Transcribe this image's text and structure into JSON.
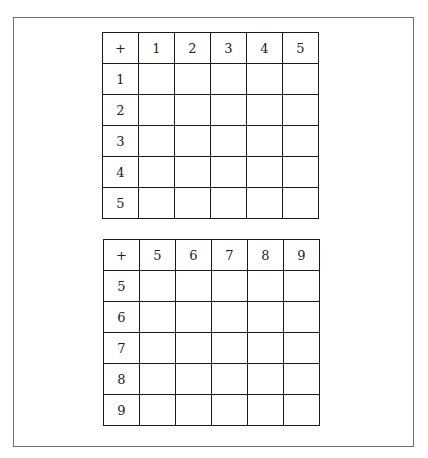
{
  "tables": [
    {
      "corner": "+",
      "columns": [
        "1",
        "2",
        "3",
        "4",
        "5"
      ],
      "rows": [
        "1",
        "2",
        "3",
        "4",
        "5"
      ]
    },
    {
      "corner": "+",
      "columns": [
        "5",
        "6",
        "7",
        "8",
        "9"
      ],
      "rows": [
        "5",
        "6",
        "7",
        "8",
        "9"
      ]
    }
  ]
}
